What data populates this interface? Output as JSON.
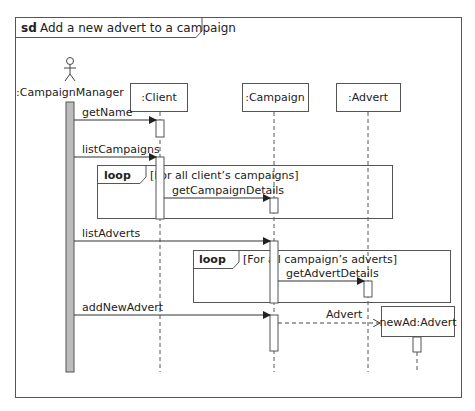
{
  "diagram": {
    "kind": "sd",
    "title": "Add a new advert to a campaign",
    "actor": {
      "label": ":CampaignManager",
      "icon": "stick-figure-icon"
    },
    "lifelines": [
      {
        "id": "client",
        "label": ":Client"
      },
      {
        "id": "campaign",
        "label": ":Campaign"
      },
      {
        "id": "advert",
        "label": ":Advert"
      },
      {
        "id": "newad",
        "label": "newAd:Advert"
      }
    ],
    "messages": [
      {
        "label": "getName",
        "from": "CampaignManager",
        "to": "client"
      },
      {
        "label": "listCampaigns",
        "from": "CampaignManager",
        "to": "client"
      },
      {
        "label": "getCampaignDetails",
        "from": "client",
        "to": "campaign"
      },
      {
        "label": "listAdverts",
        "from": "CampaignManager",
        "to": "campaign"
      },
      {
        "label": "getAdvertDetails",
        "from": "campaign",
        "to": "advert"
      },
      {
        "label": "addNewAdvert",
        "from": "CampaignManager",
        "to": "campaign"
      },
      {
        "label": "Advert",
        "from": "campaign",
        "to": "newad",
        "style": "create-dashed"
      }
    ],
    "fragments": [
      {
        "operator": "loop",
        "guard": "[For all client’s campaigns]"
      },
      {
        "operator": "loop",
        "guard": "[For all campaign’s adverts]"
      }
    ]
  },
  "colors": {
    "line": "#444444",
    "activation_actor": "#bdbdbd",
    "activation": "#ffffff"
  }
}
